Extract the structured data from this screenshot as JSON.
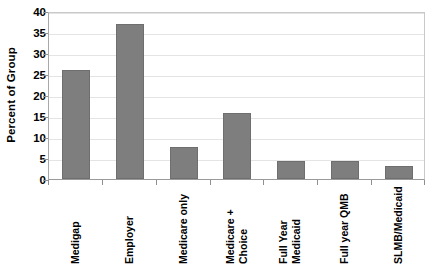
{
  "chart_data": {
    "type": "bar",
    "title": "",
    "subtitle": "",
    "xlabel": "",
    "ylabel": "Percent of Group",
    "categories": [
      "Medigap",
      "Employer",
      "Medicare only",
      "Medicare + Choice",
      "Full Year Medicaid",
      "Full year QMB",
      "SLMB/Medicaid"
    ],
    "category_lines": [
      [
        "Medigap"
      ],
      [
        "Employer"
      ],
      [
        "Medicare only"
      ],
      [
        "Medicare +",
        "Choice"
      ],
      [
        "Full Year",
        "Medicaid"
      ],
      [
        "Full year QMB"
      ],
      [
        "SLMB/Medicaid"
      ]
    ],
    "values": [
      26,
      37,
      7.5,
      15.8,
      4.2,
      4.2,
      3.2
    ],
    "ylim": [
      0,
      40
    ],
    "ytick_step": 5,
    "ytick_labels": [
      "0",
      "5",
      "10",
      "15",
      "20",
      "25",
      "30",
      "35",
      "40"
    ],
    "ytick_values": [
      0,
      5,
      10,
      15,
      20,
      25,
      30,
      35,
      40
    ],
    "grid": true,
    "grid_axis": "y",
    "legend": false,
    "legend_position": "none",
    "bar_color": "#7e7e7e",
    "bar_border_color": "#6e6e6e",
    "background_color": "#ffffff",
    "axis_color": "#9a9a9a",
    "gridline_color": "#e4e4e4",
    "text_color": "#000000"
  }
}
